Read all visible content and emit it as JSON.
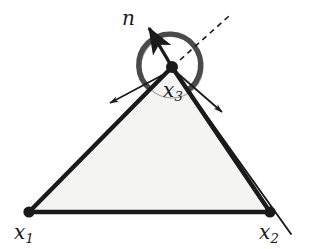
{
  "figure": {
    "background_color": "#ffffff",
    "ink_color": "#1a1a1a",
    "face_fill_color": "#f4f4f2",
    "arc_color": "#4d4d4d",
    "circle_color": "#9a9a9a"
  },
  "labels": {
    "normal": {
      "base": "n",
      "sub": ""
    },
    "vertex1": {
      "base": "x",
      "sub": "1"
    },
    "vertex2": {
      "base": "x",
      "sub": "2"
    },
    "vertex3": {
      "base": "x",
      "sub": "3"
    }
  },
  "geometry": {
    "vertices": [
      {
        "name": "x1",
        "x": 29,
        "y": 212
      },
      {
        "name": "x2",
        "x": 270,
        "y": 212
      },
      {
        "name": "x3",
        "x": 172,
        "y": 67
      }
    ],
    "normal_vector": {
      "from_x": 172,
      "from_y": 67,
      "to_x": 146,
      "to_y": 24
    },
    "dashed_ray": {
      "from_x": 172,
      "from_y": 67,
      "to_x": 228,
      "to_y": 16
    },
    "tangent_left": {
      "from_x": 172,
      "from_y": 67,
      "to_x": 107,
      "to_y": 104
    },
    "tangent_right": {
      "from_x": 172,
      "from_y": 67,
      "to_x": 226,
      "to_y": 116
    },
    "extension_right": {
      "from_x": 172,
      "from_y": 67,
      "to_x": 290,
      "to_y": 232
    },
    "angle_circle": {
      "cx": 172,
      "cy": 67,
      "r": 31
    },
    "angle_arc_degrees": 196
  }
}
